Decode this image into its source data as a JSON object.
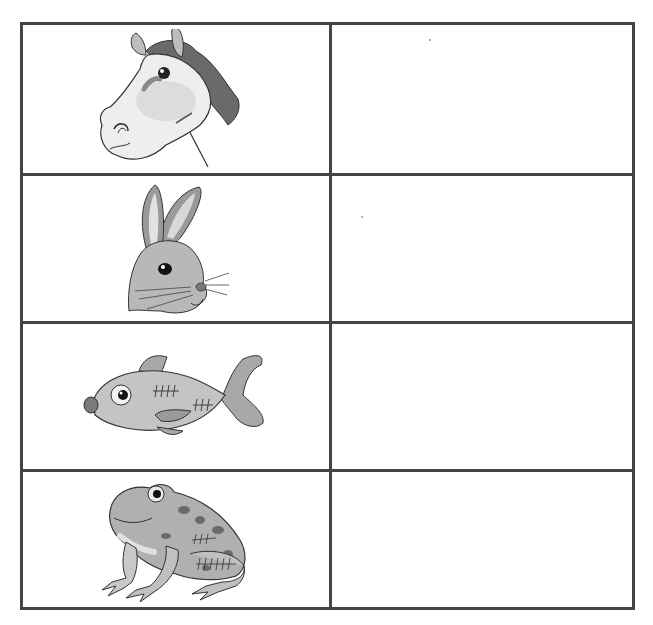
{
  "worksheet": {
    "layout": {
      "rows": 4,
      "columns": 2
    },
    "colors": {
      "grid_line": "#454545",
      "background": "#ffffff",
      "animal_fill": "#c8c8c8",
      "animal_dark": "#6e6e6e",
      "outline": "#333333"
    },
    "rows": [
      {
        "animal": "horse",
        "image_icon": "horse-head-icon",
        "answer": ""
      },
      {
        "animal": "rabbit",
        "image_icon": "rabbit-head-icon",
        "answer": ""
      },
      {
        "animal": "fish",
        "image_icon": "fish-icon",
        "answer": ""
      },
      {
        "animal": "frog",
        "image_icon": "frog-icon",
        "answer": ""
      }
    ]
  }
}
